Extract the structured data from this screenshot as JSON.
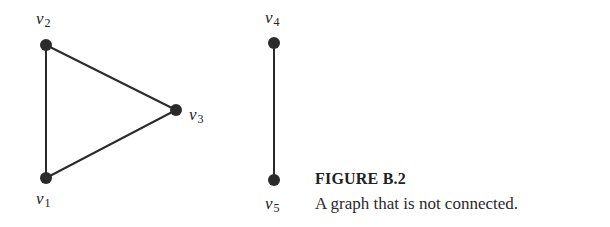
{
  "figure": {
    "label": "FIGURE B.2",
    "caption": "A graph that is not connected."
  },
  "graph": {
    "node_color": "#2b2b2b",
    "edge_color": "#2b2b2b",
    "vertices": [
      {
        "id": "v1",
        "name": "v",
        "sub": "1",
        "x": 46,
        "y": 178
      },
      {
        "id": "v2",
        "name": "v",
        "sub": "2",
        "x": 46,
        "y": 45
      },
      {
        "id": "v3",
        "name": "v",
        "sub": "3",
        "x": 176,
        "y": 110
      },
      {
        "id": "v4",
        "name": "v",
        "sub": "4",
        "x": 274,
        "y": 43
      },
      {
        "id": "v5",
        "name": "v",
        "sub": "5",
        "x": 274,
        "y": 180
      }
    ],
    "edges": [
      {
        "from": "v1",
        "to": "v2"
      },
      {
        "from": "v2",
        "to": "v3"
      },
      {
        "from": "v3",
        "to": "v1"
      },
      {
        "from": "v4",
        "to": "v5"
      }
    ],
    "components": [
      [
        "v1",
        "v2",
        "v3"
      ],
      [
        "v4",
        "v5"
      ]
    ]
  }
}
